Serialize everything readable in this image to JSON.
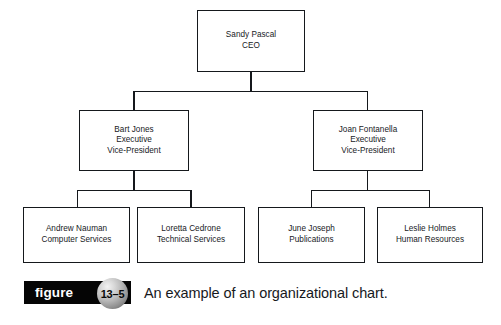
{
  "chart_data": {
    "type": "diagram",
    "diagram_type": "organizational-chart",
    "title": "An example of an organizational chart.",
    "nodes": [
      {
        "id": "ceo",
        "name": "Sandy Pascal",
        "role": "CEO",
        "level": 0
      },
      {
        "id": "vp-left",
        "name": "Bart Jones",
        "role": "Executive",
        "role2": "Vice-President",
        "level": 1
      },
      {
        "id": "vp-right",
        "name": "Joan Fontanella",
        "role": "Executive",
        "role2": "Vice-President",
        "level": 1
      },
      {
        "id": "leaf-1",
        "name": "Andrew Nauman",
        "role": "Computer Services",
        "level": 2
      },
      {
        "id": "leaf-2",
        "name": "Loretta Cedrone",
        "role": "Technical Services",
        "level": 2
      },
      {
        "id": "leaf-3",
        "name": "June Joseph",
        "role": "Publications",
        "level": 2
      },
      {
        "id": "leaf-4",
        "name": "Leslie Holmes",
        "role": "Human Resources",
        "level": 2
      }
    ],
    "edges": [
      {
        "from": "ceo",
        "to": "vp-left"
      },
      {
        "from": "ceo",
        "to": "vp-right"
      },
      {
        "from": "vp-left",
        "to": "leaf-1"
      },
      {
        "from": "vp-left",
        "to": "leaf-2"
      },
      {
        "from": "vp-right",
        "to": "leaf-3"
      },
      {
        "from": "vp-right",
        "to": "leaf-4"
      }
    ],
    "colors": {
      "box_border": "#15181c",
      "box_fill": "#ffffff",
      "text": "#17191d",
      "figure_bar": "#050505",
      "figure_bar_text": "#ffffff"
    }
  },
  "chart": {
    "ceo": {
      "name": "Sandy Pascal",
      "role": "CEO"
    },
    "vp_left": {
      "name": "Bart Jones",
      "role_line1": "Executive",
      "role_line2": "Vice-President"
    },
    "vp_right": {
      "name": "Joan Fontanella",
      "role_line1": "Executive",
      "role_line2": "Vice-President"
    },
    "leaf_1": {
      "name": "Andrew Nauman",
      "role": "Computer Services"
    },
    "leaf_2": {
      "name": "Loretta Cedrone",
      "role": "Technical Services"
    },
    "leaf_3": {
      "name": "June Joseph",
      "role": "Publications"
    },
    "leaf_4": {
      "name": "Leslie Holmes",
      "role": "Human Resources"
    }
  },
  "figure": {
    "bar_label": "figure",
    "number": "13–5",
    "caption": "An example of an organizational chart."
  }
}
